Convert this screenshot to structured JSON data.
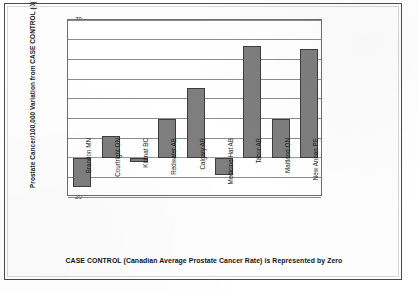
{
  "chart_data": {
    "type": "bar",
    "title": "",
    "subtitle": "",
    "xlabel": "",
    "ylabel": "Prostate Cancer/100,000 Variation from CASE CONTROL (0)",
    "caption": "CASE CONTROL (Canadian Average Prostate Cancer Rate) is Represented by Zero",
    "categories": [
      "Brandon MN",
      "Courtright ON",
      "Kitimat BC",
      "Redwater AB",
      "Calgary AB",
      "Medicine Hat AB",
      "Tabor AB",
      "Maitland ON",
      "New Annan PE"
    ],
    "values": [
      -15,
      11,
      -2,
      19.5,
      35.5,
      -9,
      57,
      19.5,
      55.5
    ],
    "ylim": [
      -20,
      70
    ],
    "yticks": [
      70,
      60,
      50,
      40,
      30,
      20,
      10,
      0,
      -10,
      -20
    ],
    "ytick_labels": [
      "70",
      "60",
      "50",
      "40",
      "30",
      "20",
      "10",
      "0",
      "-10",
      "-20"
    ],
    "grid": true,
    "legend": false,
    "legend_position": "none",
    "bar_color": "#7e7e7e",
    "bar_edge_color": "#3d3d3d",
    "axis_color": "#6d6d6d",
    "gridline_color": "#8c8c8c",
    "text_color": "#1b1b1b"
  }
}
